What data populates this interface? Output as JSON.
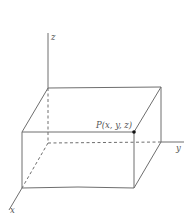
{
  "figure": {
    "type": "3D coordinate box diagram",
    "axes": {
      "x": {
        "label": "x"
      },
      "y": {
        "label": "y"
      },
      "z": {
        "label": "z"
      }
    },
    "point": {
      "label": "P(x, y, z)"
    },
    "colors": {
      "line": "#6e6e6e",
      "text": "#555555",
      "point": "#111111",
      "background": "#ffffff"
    }
  }
}
